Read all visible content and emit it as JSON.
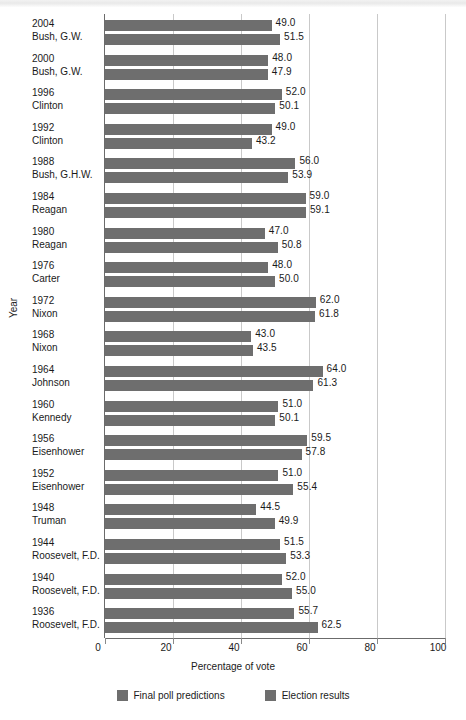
{
  "chart_data": {
    "type": "bar",
    "orientation": "horizontal",
    "title": "",
    "xlabel": "Percentage of vote",
    "ylabel": "Year",
    "xlim": [
      0,
      100
    ],
    "xticks": [
      0,
      20,
      40,
      60,
      80,
      100
    ],
    "xtick_labels": [
      "0",
      "20",
      "40",
      "60",
      "80",
      "100"
    ],
    "grid": true,
    "grid_axis": "x",
    "legend_position": "bottom",
    "bar_color": "#6e6e6e",
    "categories": [
      "2004 Bush, G.W.",
      "2000 Bush, G.W.",
      "1996 Clinton",
      "1992 Clinton",
      "1988 Bush, G.H.W.",
      "1984 Reagan",
      "1980 Reagan",
      "1976 Carter",
      "1972 Nixon",
      "1968 Nixon",
      "1964 Johnson",
      "1960 Kennedy",
      "1956 Eisenhower",
      "1952 Eisenhower",
      "1948 Truman",
      "1944 Roosevelt, F.D.",
      "1940 Roosevelt, F.D.",
      "1936 Roosevelt, F.D."
    ],
    "series": [
      {
        "name": "Final poll predictions",
        "color": "#6e6e6e",
        "values": [
          49.0,
          48.0,
          52.0,
          49.0,
          56.0,
          59.0,
          47.0,
          48.0,
          62.0,
          43.0,
          64.0,
          51.0,
          59.5,
          51.0,
          44.5,
          51.5,
          52.0,
          55.7
        ]
      },
      {
        "name": "Election results",
        "color": "#6e6e6e",
        "values": [
          51.5,
          47.9,
          50.1,
          43.2,
          53.9,
          59.1,
          50.8,
          50.0,
          61.8,
          43.5,
          61.3,
          50.1,
          57.8,
          55.4,
          49.9,
          53.3,
          55.0,
          62.5
        ]
      }
    ]
  },
  "axis": {
    "x_title": "Percentage of vote",
    "y_title": "Year",
    "tick_labels": [
      "0",
      "20",
      "40",
      "60",
      "80",
      "100"
    ]
  },
  "groups": [
    {
      "year": "2004",
      "name": "Bush, G.W.",
      "poll": "49.0",
      "result": "51.5"
    },
    {
      "year": "2000",
      "name": "Bush, G.W.",
      "poll": "48.0",
      "result": "47.9"
    },
    {
      "year": "1996",
      "name": "Clinton",
      "poll": "52.0",
      "result": "50.1"
    },
    {
      "year": "1992",
      "name": "Clinton",
      "poll": "49.0",
      "result": "43.2"
    },
    {
      "year": "1988",
      "name": "Bush, G.H.W.",
      "poll": "56.0",
      "result": "53.9"
    },
    {
      "year": "1984",
      "name": "Reagan",
      "poll": "59.0",
      "result": "59.1"
    },
    {
      "year": "1980",
      "name": "Reagan",
      "poll": "47.0",
      "result": "50.8"
    },
    {
      "year": "1976",
      "name": "Carter",
      "poll": "48.0",
      "result": "50.0"
    },
    {
      "year": "1972",
      "name": "Nixon",
      "poll": "62.0",
      "result": "61.8"
    },
    {
      "year": "1968",
      "name": "Nixon",
      "poll": "43.0",
      "result": "43.5"
    },
    {
      "year": "1964",
      "name": "Johnson",
      "poll": "64.0",
      "result": "61.3"
    },
    {
      "year": "1960",
      "name": "Kennedy",
      "poll": "51.0",
      "result": "50.1"
    },
    {
      "year": "1956",
      "name": "Eisenhower",
      "poll": "59.5",
      "result": "57.8"
    },
    {
      "year": "1952",
      "name": "Eisenhower",
      "poll": "51.0",
      "result": "55.4"
    },
    {
      "year": "1948",
      "name": "Truman",
      "poll": "44.5",
      "result": "49.9"
    },
    {
      "year": "1944",
      "name": "Roosevelt, F.D.",
      "poll": "51.5",
      "result": "53.3"
    },
    {
      "year": "1940",
      "name": "Roosevelt, F.D.",
      "poll": "52.0",
      "result": "55.0"
    },
    {
      "year": "1936",
      "name": "Roosevelt, F.D.",
      "poll": "55.7",
      "result": "62.5"
    }
  ],
  "legend": [
    {
      "label": "Final poll predictions",
      "color": "#6e6e6e"
    },
    {
      "label": "Election results",
      "color": "#6e6e6e"
    }
  ]
}
